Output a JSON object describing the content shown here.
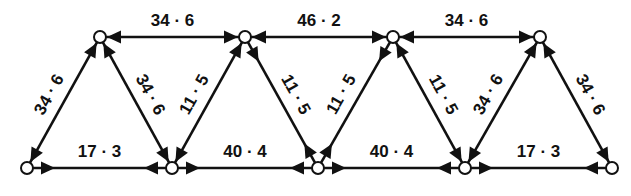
{
  "diagram": {
    "type": "truss-force-diagram",
    "colors": {
      "ink": "#111111",
      "background": "#ffffff",
      "node_fill": "#ffffff"
    },
    "nodes": [
      {
        "id": "B1",
        "x": 27,
        "y": 168
      },
      {
        "id": "B2",
        "x": 172,
        "y": 168
      },
      {
        "id": "B3",
        "x": 318,
        "y": 168
      },
      {
        "id": "B4",
        "x": 465,
        "y": 168
      },
      {
        "id": "B5",
        "x": 612,
        "y": 168
      },
      {
        "id": "T1",
        "x": 100,
        "y": 37
      },
      {
        "id": "T2",
        "x": 245,
        "y": 37
      },
      {
        "id": "T3",
        "x": 393,
        "y": 37
      },
      {
        "id": "T4",
        "x": 540,
        "y": 37
      }
    ],
    "members": [
      {
        "from": "T1",
        "to": "T2",
        "label": "34 · 6",
        "arrows": "toward-nodes"
      },
      {
        "from": "T2",
        "to": "T3",
        "label": "46 · 2",
        "arrows": "toward-nodes"
      },
      {
        "from": "T3",
        "to": "T4",
        "label": "34 · 6",
        "arrows": "toward-nodes"
      },
      {
        "from": "B1",
        "to": "B2",
        "label": "17 · 3",
        "arrows": "away-from-nodes"
      },
      {
        "from": "B2",
        "to": "B3",
        "label": "40 · 4",
        "arrows": "away-from-nodes"
      },
      {
        "from": "B3",
        "to": "B4",
        "label": "40 · 4",
        "arrows": "away-from-nodes"
      },
      {
        "from": "B4",
        "to": "B5",
        "label": "17 · 3",
        "arrows": "away-from-nodes"
      },
      {
        "from": "B1",
        "to": "T1",
        "label": "34 · 6",
        "arrows": "toward-nodes"
      },
      {
        "from": "T1",
        "to": "B2",
        "label": "34 · 6",
        "arrows": "toward-nodes"
      },
      {
        "from": "B2",
        "to": "T2",
        "label": "11 · 5",
        "arrows": "toward-nodes"
      },
      {
        "from": "T2",
        "to": "B3",
        "label": "11 · 5",
        "arrows": "away-from-nodes"
      },
      {
        "from": "B3",
        "to": "T3",
        "label": "11 · 5",
        "arrows": "away-from-nodes"
      },
      {
        "from": "T3",
        "to": "B4",
        "label": "11 · 5",
        "arrows": "toward-nodes"
      },
      {
        "from": "B4",
        "to": "T4",
        "label": "34 · 6",
        "arrows": "toward-nodes"
      },
      {
        "from": "T4",
        "to": "B5",
        "label": "34 · 6",
        "arrows": "toward-nodes"
      }
    ]
  }
}
